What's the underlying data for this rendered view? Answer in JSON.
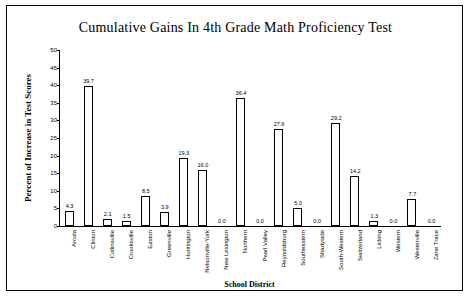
{
  "chart_data": {
    "type": "bar",
    "title": "Cumulative Gains In 4th Grade Math Proficiency Test",
    "xlabel": "School District",
    "ylabel": "Percent of Increase in Test Scores",
    "ylim": [
      0,
      50
    ],
    "yticks": [
      0,
      5,
      10,
      15,
      20,
      25,
      30,
      35,
      40,
      45,
      50
    ],
    "grid": false,
    "legend": "none",
    "categories": [
      "Arcola",
      "Clinton",
      "Collinsville",
      "Crooksville",
      "Easton",
      "Greenville",
      "Huntington",
      "Nelsonville-York",
      "New Lexington",
      "Northern",
      "Pearl Valley",
      "Reynoldsburg",
      "Southeastern",
      "Shadyside",
      "South-Western",
      "Switzerland",
      "Licking",
      "Western",
      "Westerville",
      "Zane Trace"
    ],
    "values": [
      4.3,
      39.7,
      2.1,
      1.5,
      8.5,
      3.9,
      19.3,
      16.0,
      0.0,
      36.4,
      0.0,
      27.6,
      5.0,
      0.0,
      29.2,
      14.2,
      1.3,
      0.0,
      7.7,
      0.0
    ],
    "value_labels": [
      "4.3",
      "39.7",
      "2.1",
      "1.5",
      "8.5",
      "3.9",
      "19.3",
      "16.0",
      "0.0",
      "36.4",
      "0.0",
      "27.6",
      "5.0",
      "0.0",
      "29.2",
      "14.2",
      "1.3",
      "0.0",
      "7.7",
      "0.0"
    ]
  }
}
